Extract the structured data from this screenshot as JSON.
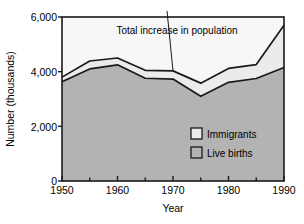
{
  "chart_data": {
    "type": "area",
    "stacked": true,
    "title": "",
    "xlabel": "Year",
    "ylabel": "Number (thousands)",
    "x": [
      1950,
      1955,
      1960,
      1965,
      1970,
      1975,
      1980,
      1985,
      1990
    ],
    "xtick_labels": [
      "1950",
      "1960",
      "1970",
      "1980",
      "1990"
    ],
    "xticks": [
      1950,
      1960,
      1970,
      1980,
      1990
    ],
    "xminor_ticks": [
      1955,
      1965,
      1975,
      1985
    ],
    "xlim": [
      1950,
      1990
    ],
    "ytick_labels": [
      "0",
      "2,000",
      "4,000",
      "6,000"
    ],
    "yticks": [
      0,
      2000,
      4000,
      6000
    ],
    "ylim": [
      0,
      6000
    ],
    "grid": false,
    "legend_position": "inside-lower-right",
    "series": [
      {
        "name": "Live births",
        "color": "#b3b3b3",
        "values": [
          3630,
          4100,
          4250,
          3760,
          3730,
          3100,
          3610,
          3750,
          4150
        ]
      },
      {
        "name": "Immigrants",
        "color": "#ebebeb",
        "values": [
          170,
          290,
          250,
          290,
          300,
          480,
          510,
          510,
          1550
        ]
      }
    ],
    "total": {
      "name": "Total increase in population",
      "values": [
        3800,
        4390,
        4500,
        4050,
        4030,
        3580,
        4120,
        4260,
        5700
      ]
    },
    "annotations": [
      {
        "text": "Total increase in population",
        "x": 1970,
        "y": 5200,
        "leader_to_x": 1970,
        "leader_to_y": 4030
      }
    ],
    "above_total_color": "#f7f7f7"
  },
  "axes": {
    "ylabel": "Number (thousands)",
    "xlabel": "Year",
    "ytick_labels": [
      "6,000",
      "4,000",
      "2,000",
      "0"
    ],
    "xtick_labels": [
      "1950",
      "1960",
      "1970",
      "1980",
      "1990"
    ]
  },
  "legend": {
    "items": [
      {
        "label": "Immigrants",
        "swatch_color": "#ebebeb"
      },
      {
        "label": "Live births",
        "swatch_color": "#b3b3b3"
      }
    ]
  },
  "annotation": {
    "text": "Total increase in population"
  }
}
